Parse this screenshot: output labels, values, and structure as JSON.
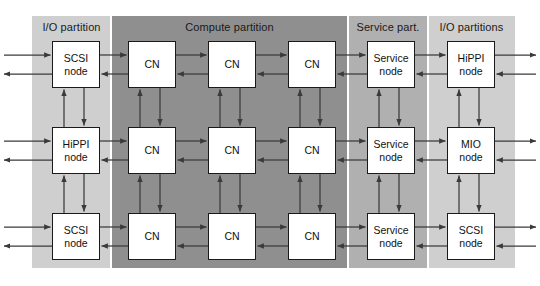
{
  "figure": {
    "background": "#ffffff",
    "outer_border_color": "#1a1a1a"
  },
  "colors": {
    "io_partition_fill": "#cfcfcf",
    "compute_partition_fill": "#8f8f8f",
    "service_partition_fill": "#b0b0b0",
    "node_fill": "#ffffff",
    "node_border": "#1a1a1a",
    "arrow_color": "#3a3a3a",
    "text_color": "#1a1a1a"
  },
  "partitions": [
    {
      "id": "io-left",
      "label": "I/O partition",
      "fill": "#cfcfcf",
      "x": 32,
      "width": 79
    },
    {
      "id": "compute",
      "label": "Compute partition",
      "fill": "#8f8f8f",
      "x": 111,
      "width": 237
    },
    {
      "id": "service",
      "label": "Service part.",
      "fill": "#b0b0b0",
      "x": 348,
      "width": 80
    },
    {
      "id": "io-right",
      "label": "I/O partitions",
      "fill": "#cfcfcf",
      "x": 428,
      "width": 87
    }
  ],
  "columns": [
    {
      "id": "col-io-left",
      "partition": "io-left",
      "x": 52
    },
    {
      "id": "col-cn-1",
      "partition": "compute",
      "x": 128
    },
    {
      "id": "col-cn-2",
      "partition": "compute",
      "x": 208
    },
    {
      "id": "col-cn-3",
      "partition": "compute",
      "x": 288
    },
    {
      "id": "col-service",
      "partition": "service",
      "x": 367
    },
    {
      "id": "col-io-right",
      "partition": "io-right",
      "x": 447
    }
  ],
  "rows": [
    {
      "id": "row-1",
      "y": 41
    },
    {
      "id": "row-2",
      "y": 127
    },
    {
      "id": "row-3",
      "y": 213
    }
  ],
  "nodes": [
    {
      "id": "n-r1-c1",
      "row": 0,
      "col": 0,
      "line1": "SCSI",
      "line2": "node"
    },
    {
      "id": "n-r1-c2",
      "row": 0,
      "col": 1,
      "line1": "CN",
      "line2": ""
    },
    {
      "id": "n-r1-c3",
      "row": 0,
      "col": 2,
      "line1": "CN",
      "line2": ""
    },
    {
      "id": "n-r1-c4",
      "row": 0,
      "col": 3,
      "line1": "CN",
      "line2": ""
    },
    {
      "id": "n-r1-c5",
      "row": 0,
      "col": 4,
      "line1": "Service",
      "line2": "node"
    },
    {
      "id": "n-r1-c6",
      "row": 0,
      "col": 5,
      "line1": "HiPPI",
      "line2": "node"
    },
    {
      "id": "n-r2-c1",
      "row": 1,
      "col": 0,
      "line1": "HiPPI",
      "line2": "node"
    },
    {
      "id": "n-r2-c2",
      "row": 1,
      "col": 1,
      "line1": "CN",
      "line2": ""
    },
    {
      "id": "n-r2-c3",
      "row": 1,
      "col": 2,
      "line1": "CN",
      "line2": ""
    },
    {
      "id": "n-r2-c4",
      "row": 1,
      "col": 3,
      "line1": "CN",
      "line2": ""
    },
    {
      "id": "n-r2-c5",
      "row": 1,
      "col": 4,
      "line1": "Service",
      "line2": "node"
    },
    {
      "id": "n-r2-c6",
      "row": 1,
      "col": 5,
      "line1": "MIO",
      "line2": "node"
    },
    {
      "id": "n-r3-c1",
      "row": 2,
      "col": 0,
      "line1": "SCSI",
      "line2": "node"
    },
    {
      "id": "n-r3-c2",
      "row": 2,
      "col": 1,
      "line1": "CN",
      "line2": ""
    },
    {
      "id": "n-r3-c3",
      "row": 2,
      "col": 2,
      "line1": "CN",
      "line2": ""
    },
    {
      "id": "n-r3-c4",
      "row": 2,
      "col": 3,
      "line1": "CN",
      "line2": ""
    },
    {
      "id": "n-r3-c5",
      "row": 2,
      "col": 4,
      "line1": "Service",
      "line2": "node"
    },
    {
      "id": "n-r3-c6",
      "row": 2,
      "col": 5,
      "line1": "SCSI",
      "line2": "node"
    }
  ],
  "geometry": {
    "panel": {
      "x": 32,
      "y": 16,
      "width": 483,
      "height": 252
    },
    "node_width": 48,
    "node_height": 47,
    "row_in_offset": 14,
    "row_out_offset": 33,
    "col_up_offset": 12,
    "col_down_offset": 32
  },
  "edges": {
    "horizontal_right_label": "rightward data link",
    "horizontal_left_label": "leftward data link",
    "vertical_up_label": "upward data link",
    "vertical_down_label": "downward data link",
    "external_in_label": "external inbound link",
    "external_out_label": "external outbound link"
  }
}
